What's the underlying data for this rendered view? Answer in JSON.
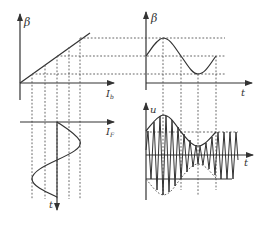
{
  "figure": {
    "colors": {
      "ink": "#333333",
      "dash": "#555555",
      "background": "#ffffff"
    },
    "panels": {
      "top_left": {
        "y_label": "β",
        "x_label": "I",
        "x_label_sub": "b",
        "description": "Linear transfer characteristic: β increases linearly with I_b"
      },
      "top_right": {
        "y_label": "β",
        "x_label": "t",
        "description": "β varies sinusoidally with time"
      },
      "bottom_left": {
        "x_label": "I",
        "x_label_sub": "F",
        "y_label": "t",
        "description": "Modulating current I_F varies sinusoidally with time (time axis pointing down)"
      },
      "bottom_right": {
        "y_label": "u",
        "x_label": "t",
        "description": "Output u: high-frequency carrier with amplitude envelope following β(t)"
      }
    }
  }
}
